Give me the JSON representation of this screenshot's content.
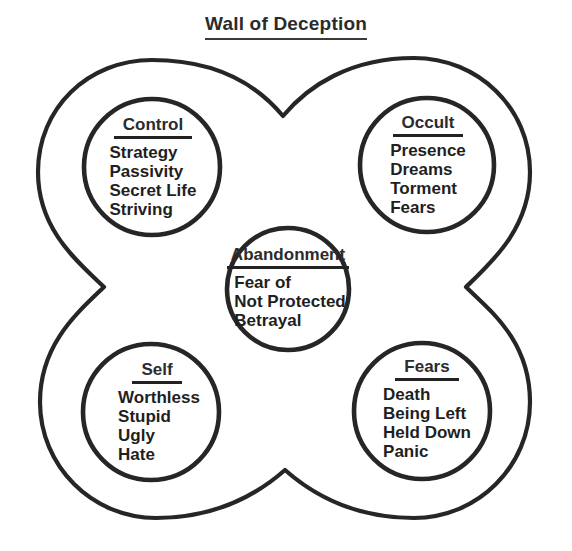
{
  "title": "Wall of Deception",
  "colors": {
    "stroke": "#262626",
    "text": "#1f1f1f",
    "background": "#ffffff"
  },
  "outer_shape": {
    "name": "quatrefoil-wall-outline",
    "lobes": 4
  },
  "nodes": [
    {
      "id": "control",
      "heading": "Control",
      "items": [
        "Strategy",
        "Passivity",
        "Secret Life",
        "Striving"
      ],
      "position": "top-left"
    },
    {
      "id": "occult",
      "heading": "Occult",
      "items": [
        "Presence",
        "Dreams",
        "Torment",
        "Fears"
      ],
      "position": "top-right"
    },
    {
      "id": "abandonment",
      "heading": "Abandonment",
      "items": [
        "Fear of",
        "Not Protected",
        "Betrayal"
      ],
      "position": "center"
    },
    {
      "id": "self",
      "heading": "Self",
      "items": [
        "Worthless",
        "Stupid",
        "Ugly",
        "Hate"
      ],
      "position": "bottom-left"
    },
    {
      "id": "fears",
      "heading": "Fears",
      "items": [
        "Death",
        "Being Left",
        "Held Down",
        "Panic"
      ],
      "position": "bottom-right"
    }
  ]
}
